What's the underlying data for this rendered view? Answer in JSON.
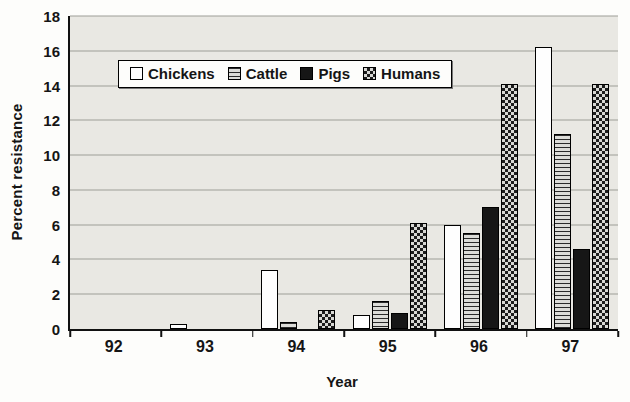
{
  "figure": {
    "y_axis_title": "Percent resistance",
    "x_axis_title": "Year"
  },
  "chart_data": {
    "type": "bar",
    "title": "",
    "xlabel": "Year",
    "ylabel": "Percent resistance",
    "ylim": [
      0,
      18
    ],
    "ytick_step": 2,
    "grid": true,
    "legend_position": "top-inside",
    "categories": [
      "92",
      "93",
      "94",
      "95",
      "96",
      "97"
    ],
    "series": [
      {
        "name": "Chickens",
        "pattern": "white",
        "values": [
          0,
          0.3,
          3.4,
          0.8,
          6.0,
          16.2
        ]
      },
      {
        "name": "Cattle",
        "pattern": "hlines",
        "values": [
          0,
          0,
          0.4,
          1.6,
          5.5,
          11.2
        ]
      },
      {
        "name": "Pigs",
        "pattern": "solid-black",
        "values": [
          0,
          0,
          0,
          0.9,
          7.0,
          4.6
        ]
      },
      {
        "name": "Humans",
        "pattern": "checker",
        "values": [
          0,
          0,
          1.1,
          6.1,
          14.1,
          14.1
        ]
      }
    ],
    "colors": {
      "plot_background": "#e9e8e3",
      "gridline": "#9e9e98",
      "axis": "#111111",
      "bar_outline": "#000000"
    }
  }
}
